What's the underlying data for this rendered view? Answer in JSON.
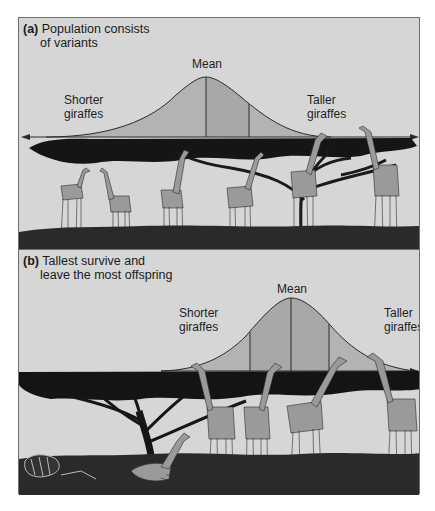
{
  "figure": {
    "panel_a": {
      "letter": "(a)",
      "caption_line1": "Population consists",
      "caption_line2": "of variants",
      "mean_label": "Mean",
      "left_label_line1": "Shorter",
      "left_label_line2": "giraffes",
      "right_label_line1": "Taller",
      "right_label_line2": "giraffes",
      "giraffe_count": 6
    },
    "panel_b": {
      "letter": "(b)",
      "caption_line1": "Tallest survive and",
      "caption_line2": "leave the most offspring",
      "mean_label": "Mean",
      "left_label_line1": "Shorter",
      "left_label_line2": "giraffes",
      "right_label_line1": "Taller",
      "right_label_line2": "giraffes",
      "giraffe_count_standing": 4,
      "giraffe_count_fallen": 1
    },
    "colors": {
      "sky": "#d6d6d6",
      "curve_fill": "#b4b4b4",
      "curve_fill_center": "#a9a9a9",
      "curve_line": "#2a2a2a",
      "canopy": "#141414",
      "ground": "#2b2b2b",
      "giraffe_body": "#9a9a9a",
      "giraffe_spots": "#3a3a3a"
    }
  }
}
